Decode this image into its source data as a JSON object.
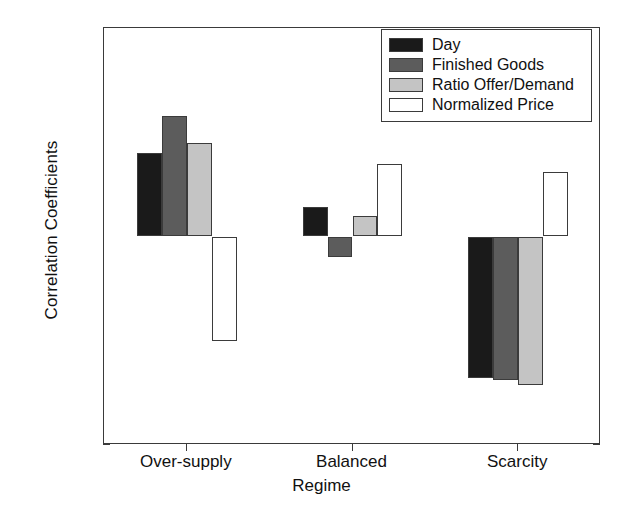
{
  "chart_data": {
    "type": "bar",
    "title": "",
    "xlabel": "Regime",
    "ylabel": "Correlation Coefficients",
    "categories": [
      "Over-supply",
      "Balanced",
      "Scarcity"
    ],
    "ylim": [
      -1,
      1
    ],
    "xlim": [
      0,
      3
    ],
    "yticks": [
      1,
      0.8,
      0.6,
      0.4,
      0.2,
      0,
      -0.2,
      -0.4,
      -0.6,
      -0.8,
      -1
    ],
    "ytick_labels": [
      "1",
      "0.8",
      "0.6",
      "0.4",
      "0.2",
      "0",
      "-0.2",
      "-0.4",
      "-0.6",
      "-0.8",
      "-1"
    ],
    "grid": false,
    "legend_position": "top-right",
    "series": [
      {
        "name": "Day",
        "color": "#1a1a1a",
        "values": [
          0.4,
          0.14,
          -0.68
        ]
      },
      {
        "name": "Finished Goods",
        "color": "#5c5c5c",
        "values": [
          0.58,
          -0.1,
          -0.69
        ]
      },
      {
        "name": "Ratio Offer/Demand",
        "color": "#c4c4c4",
        "values": [
          0.45,
          0.1,
          -0.71
        ]
      },
      {
        "name": "Normalized Price",
        "color": "#ffffff",
        "values": [
          -0.5,
          0.35,
          0.31
        ]
      }
    ]
  },
  "axes": {
    "y_title": "Correlation Coefficients",
    "x_title": "Regime"
  },
  "legend": {
    "entries": [
      {
        "label": "Day",
        "color": "#1a1a1a"
      },
      {
        "label": "Finished Goods",
        "color": "#5c5c5c"
      },
      {
        "label": "Ratio Offer/Demand",
        "color": "#c4c4c4"
      },
      {
        "label": "Normalized Price",
        "color": "#ffffff"
      }
    ]
  },
  "style": {
    "axis_color": "#3a3a3a",
    "text_color": "#111111",
    "background": "#ffffff"
  }
}
